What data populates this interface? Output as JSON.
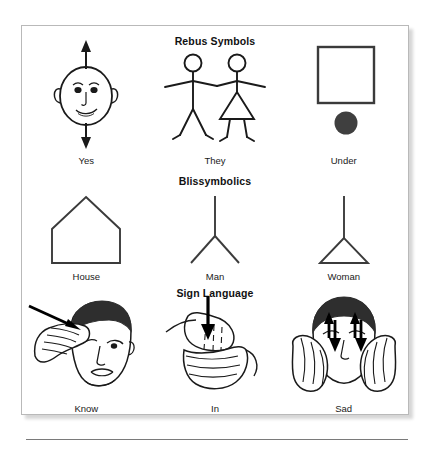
{
  "figure": {
    "sections": [
      {
        "id": "rebus",
        "heading": "Rebus Symbols",
        "items": [
          {
            "label": "Yes",
            "icon": "nodding-head-symbol"
          },
          {
            "label": "They",
            "icon": "two-stick-figures-holding-hands-symbol"
          },
          {
            "label": "Under",
            "icon": "square-over-dot-symbol"
          }
        ]
      },
      {
        "id": "blissymbolics",
        "heading": "Blissymbolics",
        "items": [
          {
            "label": "House",
            "icon": "pentagon-house-symbol"
          },
          {
            "label": "Man",
            "icon": "stem-with-legs-symbol"
          },
          {
            "label": "Woman",
            "icon": "stem-with-skirt-triangle-symbol"
          }
        ]
      },
      {
        "id": "sign-language",
        "heading": "Sign Language",
        "items": [
          {
            "label": "Know",
            "icon": "hand-to-forehead-sign"
          },
          {
            "label": "In",
            "icon": "hand-into-cupped-hand-sign"
          },
          {
            "label": "Sad",
            "icon": "two-hands-down-face-sign"
          }
        ]
      }
    ]
  },
  "colors": {
    "ink": "#1a1a1a",
    "frame_border": "#b9b9b9",
    "fill_dark": "#3b3b3b",
    "page_background": "#ffffff"
  }
}
